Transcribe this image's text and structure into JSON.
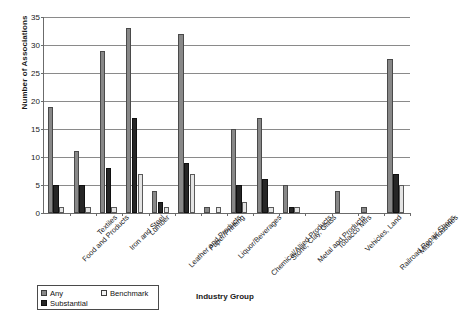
{
  "chart_data": {
    "type": "bar",
    "title": "",
    "xlabel": "Industry Group",
    "ylabel": "Number of Associations",
    "ylim": [
      0,
      35
    ],
    "yticks": [
      0,
      5,
      10,
      15,
      20,
      25,
      30,
      35
    ],
    "grid": true,
    "legend_position": "bottom-left",
    "categories": [
      "Food and Products",
      "Textiles",
      "Iron and Steel",
      "Lumber",
      "Leather and Products",
      "Paper/Printing",
      "Liquor/Beverages",
      "Chemical/Allied Products",
      "Stone, Clay, Glass",
      "Metal and Products",
      "Tobacco Mfrs",
      "Vehicles, Land",
      "Railroad Repair Shops",
      "Misc. Industries"
    ],
    "series": [
      {
        "name": "Any",
        "color": "#888888",
        "values": [
          19,
          11,
          29,
          33,
          4,
          32,
          1,
          15,
          17,
          5,
          0,
          4,
          1,
          27.5
        ]
      },
      {
        "name": "Benchmark",
        "color": "#e4e4e4",
        "values": [
          1,
          1,
          1,
          7,
          1,
          7,
          1,
          2,
          1,
          1,
          0,
          0,
          0,
          5
        ]
      },
      {
        "name": "Substantial",
        "color": "#262626",
        "values": [
          5,
          5,
          8,
          17,
          2,
          9,
          0,
          5,
          6,
          1,
          0,
          0,
          0,
          7
        ]
      }
    ]
  },
  "legend": {
    "items": [
      {
        "label": "Any",
        "key": "any"
      },
      {
        "label": "Benchmark",
        "key": "bench"
      },
      {
        "label": "Substantial",
        "key": "sub"
      }
    ]
  }
}
